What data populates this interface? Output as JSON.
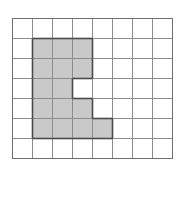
{
  "figure": {
    "type": "grid-shape",
    "grid": {
      "columns": 8,
      "rows": 7,
      "cell_size_px": 20,
      "origin_x_px": 12,
      "origin_y_px": 18,
      "line_color": "#8c8c8c",
      "border_color": "#6e6e6e"
    },
    "shape": {
      "name": "shaded-region",
      "fill_color": "#c9c9c9",
      "outline_color": "#4a4a4a",
      "empty_color": "#ffffff",
      "filled_cell_count": 16,
      "filled_cells": [
        {
          "row": 1,
          "col": 1
        },
        {
          "row": 1,
          "col": 2
        },
        {
          "row": 1,
          "col": 3
        },
        {
          "row": 2,
          "col": 1
        },
        {
          "row": 2,
          "col": 2
        },
        {
          "row": 2,
          "col": 3
        },
        {
          "row": 3,
          "col": 1
        },
        {
          "row": 3,
          "col": 2
        },
        {
          "row": 4,
          "col": 1
        },
        {
          "row": 4,
          "col": 2
        },
        {
          "row": 4,
          "col": 3
        },
        {
          "row": 5,
          "col": 1
        },
        {
          "row": 5,
          "col": 2
        },
        {
          "row": 5,
          "col": 3
        },
        {
          "row": 5,
          "col": 4
        },
        {
          "row": 2,
          "col": 3
        }
      ],
      "rows_description": [
        {
          "row": 0,
          "filled_columns": []
        },
        {
          "row": 1,
          "filled_columns": [
            1,
            2,
            3
          ]
        },
        {
          "row": 2,
          "filled_columns": [
            1,
            2,
            3
          ]
        },
        {
          "row": 3,
          "filled_columns": [
            1,
            2
          ]
        },
        {
          "row": 4,
          "filled_columns": [
            1,
            2,
            3
          ]
        },
        {
          "row": 5,
          "filled_columns": [
            1,
            2,
            3,
            4
          ]
        },
        {
          "row": 6,
          "filled_columns": []
        }
      ]
    }
  }
}
